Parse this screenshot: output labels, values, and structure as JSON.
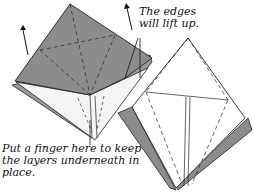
{
  "diagram": {
    "type": "origami-instruction",
    "colors": {
      "paper_gray": "#8c8c8c",
      "paper_light": "#e6e6e6",
      "line": "#222222"
    },
    "annotations": {
      "edges": [
        "The edges",
        "will lift up."
      ],
      "finger": [
        "Put a finger here to keep",
        "the layers underneath in",
        "place."
      ]
    }
  }
}
